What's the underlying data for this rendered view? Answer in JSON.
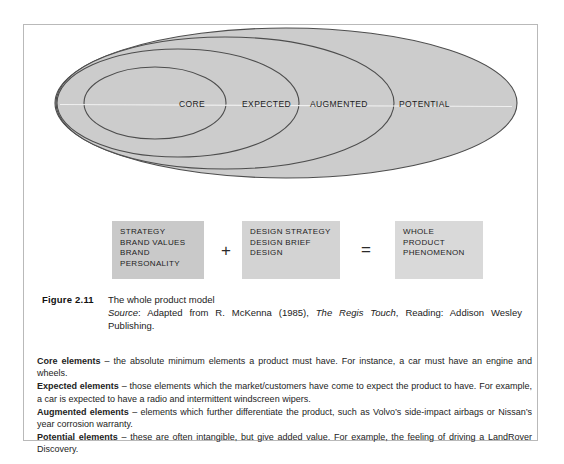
{
  "figure": {
    "diagram": {
      "type": "nested-ellipse",
      "rings": [
        {
          "id": "core",
          "label": "CORE"
        },
        {
          "id": "expected",
          "label": "EXPECTED"
        },
        {
          "id": "augmented",
          "label": "AUGMENTED"
        },
        {
          "id": "potential",
          "label": "POTENTIAL"
        }
      ],
      "fill_color": "#cccccc",
      "stroke_color": "#4a4a4a"
    },
    "equation": {
      "boxes": [
        {
          "id": "strategy",
          "lines": [
            "STRATEGY",
            "BRAND VALUES",
            "BRAND",
            "PERSONALITY"
          ]
        },
        {
          "id": "design",
          "lines": [
            "DESIGN STRATEGY",
            "DESIGN BRIEF",
            "DESIGN"
          ]
        },
        {
          "id": "whole-product",
          "lines": [
            "WHOLE",
            "PRODUCT",
            "PHENOMENON"
          ]
        }
      ],
      "operators": {
        "plus": "+",
        "equals": "="
      }
    },
    "caption": {
      "label": "Figure 2.11",
      "title": "The whole product model",
      "source_prefix": "Source",
      "source_mid": ": Adapted from R. McKenna (1985), ",
      "source_italic_title": "The Regis Touch",
      "source_suffix": ", Reading: Addison Wesley Publishing."
    }
  },
  "definitions": [
    {
      "term": "Core elements",
      "text": " – the absolute minimum elements a product must have. For instance, a car must have an engine and wheels."
    },
    {
      "term": "Expected elements",
      "text": " – those elements which the market/customers have come to expect the product to have. For example, a car is expected to have a radio and intermittent windscreen wipers."
    },
    {
      "term": "Augmented elements",
      "text": " – elements which further differentiate the product, such as Volvo’s side-impact airbags or Nissan’s year corrosion warranty."
    },
    {
      "term": "Potential elements",
      "text": " – these are often intangible, but give added value. For example, the feeling of driving a LandRover Discovery."
    }
  ]
}
